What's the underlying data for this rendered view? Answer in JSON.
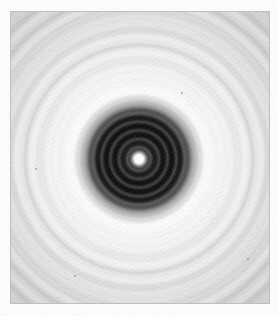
{
  "page": {
    "background_color": "#fdfdfd",
    "width": 278,
    "height": 316
  },
  "photo": {
    "label": "diffraction-ring-photograph",
    "left": 11,
    "top": 12,
    "width": 258,
    "height": 291,
    "base_tone": "#bdbdbd",
    "border_color": "#8c8c8c"
  },
  "pattern": {
    "name": "concentric-ring-diffraction-pattern",
    "center_x_page": 139,
    "center_y_page": 159,
    "center_x_photo": 128,
    "center_y_photo": 147,
    "center_spot_color": "#ffffff",
    "center_spot_radius": 4,
    "dark_core_color": "#0a0a0a",
    "dark_core_radius": 50,
    "halo_color": "#ffffff",
    "halo_inner_radius": 56,
    "halo_outer_radius": 96,
    "core_ring_period": 8.6,
    "outer_ring_period": 17,
    "visible_core_rings": 6,
    "visible_outer_rings": 9
  },
  "chart_data": {
    "type": "heatmap",
    "title": "Concentric ring diffraction pattern",
    "xlabel": "",
    "ylabel": "",
    "radial_profile": {
      "x": "radius_px_from_center",
      "y": "relative_intensity_0_to_1",
      "radius_px": [
        0,
        3,
        5,
        8,
        11,
        15,
        20,
        25,
        30,
        34,
        38,
        42,
        46,
        50,
        56,
        62,
        68,
        76,
        84,
        92,
        100,
        110,
        120,
        130,
        140
      ],
      "intensity": [
        1.0,
        0.97,
        0.72,
        0.18,
        0.09,
        0.12,
        0.07,
        0.11,
        0.06,
        0.1,
        0.06,
        0.09,
        0.14,
        0.3,
        0.62,
        0.86,
        0.94,
        0.9,
        0.82,
        0.86,
        0.8,
        0.84,
        0.79,
        0.83,
        0.78
      ]
    },
    "ring_radii_px": [
      10,
      18,
      27,
      35,
      43,
      50,
      66,
      83,
      100,
      117,
      134,
      151,
      168,
      185
    ],
    "ring_kind": [
      "dark",
      "dark",
      "dark",
      "dark",
      "dark",
      "dark",
      "bright",
      "bright",
      "bright",
      "bright",
      "bright",
      "bright",
      "bright",
      "bright"
    ],
    "grid": false,
    "legend": "none",
    "colormap": "grayscale"
  },
  "specks": [
    {
      "left": 24,
      "top": 156,
      "size": 2
    },
    {
      "left": 170,
      "top": 80,
      "size": 2
    },
    {
      "left": 63,
      "top": 263,
      "size": 2
    },
    {
      "left": 236,
      "top": 246,
      "size": 2
    }
  ],
  "caption": "Photograph of a concentric ring diffraction pattern with a bright central spot."
}
